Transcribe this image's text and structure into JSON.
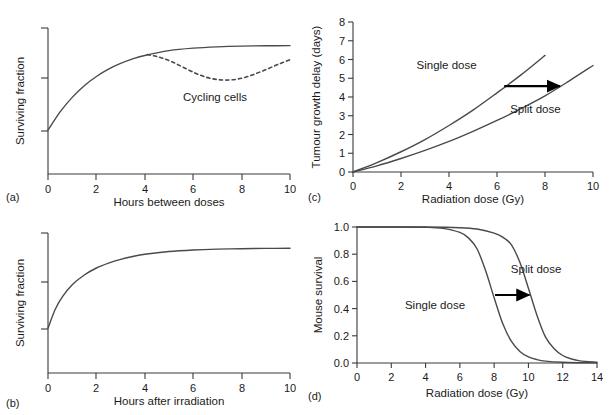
{
  "figure": {
    "background": "#ffffff",
    "curve_color": "#4a4a4a",
    "axis_color": "#3a3a3a",
    "arrow_color": "#000000"
  },
  "chart_data": [
    {
      "panel": "(a)",
      "type": "line",
      "title": "",
      "xlabel": "Hours between doses",
      "ylabel": "Surviving fraction",
      "xlim": [
        0,
        10
      ],
      "ylim": [
        0,
        1
      ],
      "xticks": [
        0,
        2,
        4,
        6,
        8,
        10
      ],
      "xticklabels": [
        "0",
        "2",
        "4",
        "6",
        "8",
        "10"
      ],
      "yticks": [
        0.3,
        0.62,
        0.92
      ],
      "yticklabels": [
        "",
        "",
        ""
      ],
      "grid": false,
      "legend": "none",
      "series": [
        {
          "name": "Repair (non-cycling)",
          "style": "solid",
          "x": [
            0,
            0.5,
            1,
            1.5,
            2,
            2.5,
            3,
            3.5,
            4,
            5,
            6,
            7,
            8,
            9,
            10
          ],
          "y": [
            0.3,
            0.425,
            0.525,
            0.605,
            0.668,
            0.718,
            0.757,
            0.788,
            0.812,
            0.845,
            0.862,
            0.871,
            0.876,
            0.878,
            0.879
          ]
        },
        {
          "name": "Cycling cells",
          "style": "dashed",
          "x": [
            4.1,
            4.6,
            5.1,
            5.6,
            6.1,
            6.6,
            7.1,
            7.6,
            8.1,
            8.6,
            9.1,
            9.6,
            10
          ],
          "y": [
            0.818,
            0.8,
            0.77,
            0.73,
            0.69,
            0.66,
            0.645,
            0.645,
            0.66,
            0.688,
            0.722,
            0.757,
            0.783
          ]
        }
      ],
      "annotations": [
        {
          "text": "Cycling cells",
          "x": 6.9,
          "y": 0.5
        }
      ]
    },
    {
      "panel": "(b)",
      "type": "line",
      "title": "",
      "xlabel": "Hours after irradiation",
      "ylabel": "Surviving fraction",
      "xlim": [
        0,
        10
      ],
      "ylim": [
        0,
        1
      ],
      "xticks": [
        0,
        2,
        4,
        6,
        8,
        10
      ],
      "xticklabels": [
        "0",
        "2",
        "4",
        "6",
        "8",
        "10"
      ],
      "yticks": [
        0.33,
        0.66,
        0.96
      ],
      "yticklabels": [
        "",
        "",
        ""
      ],
      "grid": false,
      "legend": "none",
      "series": [
        {
          "name": "Recovery",
          "style": "solid",
          "x": [
            0,
            0.3,
            0.6,
            1,
            1.5,
            2,
            2.5,
            3,
            3.5,
            4,
            5,
            6,
            7,
            8,
            9,
            10
          ],
          "y": [
            0.32,
            0.455,
            0.545,
            0.63,
            0.7,
            0.75,
            0.785,
            0.812,
            0.832,
            0.848,
            0.868,
            0.879,
            0.885,
            0.888,
            0.89,
            0.891
          ]
        }
      ],
      "annotations": []
    },
    {
      "panel": "(c)",
      "type": "line",
      "title": "",
      "xlabel": "Radiation dose (Gy)",
      "ylabel": "Tumour growth delay (days)",
      "xlim": [
        0,
        10
      ],
      "ylim": [
        0,
        8
      ],
      "xticks": [
        0,
        2,
        4,
        6,
        8,
        10
      ],
      "xticklabels": [
        "0",
        "2",
        "4",
        "6",
        "8",
        "10"
      ],
      "yticks": [
        0,
        1,
        2,
        3,
        4,
        5,
        6,
        7,
        8
      ],
      "yticklabels": [
        "0",
        "1",
        "2",
        "3",
        "4",
        "5",
        "6",
        "7",
        "8"
      ],
      "grid": false,
      "legend": "none",
      "series": [
        {
          "name": "Single dose",
          "style": "solid",
          "x": [
            0,
            1,
            2,
            3,
            4,
            5,
            6,
            7,
            8
          ],
          "y": [
            0.0,
            0.5,
            1.08,
            1.73,
            2.48,
            3.3,
            4.22,
            5.18,
            6.22
          ]
        },
        {
          "name": "Split dose",
          "style": "solid",
          "x": [
            0,
            1,
            2,
            3,
            4,
            5,
            6,
            7,
            8,
            9,
            10
          ],
          "y": [
            0.0,
            0.33,
            0.72,
            1.15,
            1.63,
            2.17,
            2.75,
            3.38,
            4.06,
            4.85,
            5.68
          ]
        }
      ],
      "annotations": [
        {
          "text": "Single dose",
          "x": 3.9,
          "y": 5.52
        },
        {
          "text": "Split dose",
          "x": 7.6,
          "y": 3.15
        }
      ],
      "arrows": [
        {
          "x1": 6.3,
          "y1": 4.58,
          "x2": 8.62,
          "y2": 4.58
        }
      ]
    },
    {
      "panel": "(d)",
      "type": "line",
      "title": "",
      "xlabel": "Radiation dose (Gy)",
      "ylabel": "Mouse survival",
      "xlim": [
        0,
        14
      ],
      "ylim": [
        0,
        1
      ],
      "xticks": [
        0,
        2,
        4,
        6,
        8,
        10,
        12,
        14
      ],
      "xticklabels": [
        "0",
        "2",
        "4",
        "6",
        "8",
        "10",
        "12",
        "14"
      ],
      "yticks": [
        0.0,
        0.2,
        0.4,
        0.6,
        0.8,
        1.0
      ],
      "yticklabels": [
        "0.0",
        "0.2",
        "0.4",
        "0.6",
        "0.8",
        "1.0"
      ],
      "grid": false,
      "legend": "none",
      "series": [
        {
          "name": "Single dose",
          "style": "solid",
          "x": [
            0,
            2,
            4,
            5,
            6,
            6.5,
            7,
            7.5,
            8,
            8.5,
            9,
            9.5,
            10,
            10.5,
            11,
            12,
            13,
            14
          ],
          "y": [
            1.0,
            1.0,
            0.998,
            0.99,
            0.96,
            0.92,
            0.84,
            0.68,
            0.48,
            0.29,
            0.16,
            0.085,
            0.045,
            0.025,
            0.014,
            0.005,
            0.002,
            0.001
          ]
        },
        {
          "name": "Split dose",
          "style": "solid",
          "x": [
            0,
            2,
            4,
            6,
            7,
            8,
            8.5,
            9,
            9.5,
            10,
            10.5,
            11,
            11.5,
            12,
            12.5,
            13,
            14
          ],
          "y": [
            1.0,
            1.0,
            1.0,
            0.995,
            0.985,
            0.955,
            0.925,
            0.87,
            0.74,
            0.55,
            0.35,
            0.19,
            0.105,
            0.055,
            0.03,
            0.016,
            0.005
          ]
        }
      ],
      "annotations": [
        {
          "text": "Split dose",
          "x": 10.45,
          "y": 0.66
        },
        {
          "text": "Single dose",
          "x": 4.55,
          "y": 0.4
        }
      ],
      "arrows": [
        {
          "x1": 8.05,
          "y1": 0.5,
          "x2": 10.05,
          "y2": 0.5
        }
      ]
    }
  ]
}
